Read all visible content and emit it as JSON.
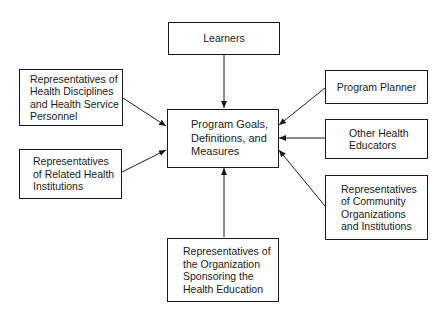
{
  "diagram": {
    "center": {
      "label": "Program Goals,\nDefinitions, and\nMeasures"
    },
    "nodes": [
      {
        "id": "learners",
        "label": "Learners"
      },
      {
        "id": "health-disciplines",
        "label": "Representatives of\nHealth Disciplines\nand Health Service\nPersonnel"
      },
      {
        "id": "related-institutions",
        "label": "Representatives\nof Related Health\nInstitutions"
      },
      {
        "id": "program-planner",
        "label": "Program Planner"
      },
      {
        "id": "other-educators",
        "label": "Other Health\nEducators"
      },
      {
        "id": "community-orgs",
        "label": "Representatives\nof Community\nOrganizations\nand Institutions"
      },
      {
        "id": "sponsoring-org",
        "label": "Representatives of\nthe Organization\nSponsoring the\nHealth Education"
      }
    ],
    "edges": [
      {
        "from": "learners",
        "to": "center"
      },
      {
        "from": "health-disciplines",
        "to": "center"
      },
      {
        "from": "related-institutions",
        "to": "center"
      },
      {
        "from": "program-planner",
        "to": "center"
      },
      {
        "from": "other-educators",
        "to": "center"
      },
      {
        "from": "community-orgs",
        "to": "center"
      },
      {
        "from": "sponsoring-org",
        "to": "center"
      }
    ]
  }
}
